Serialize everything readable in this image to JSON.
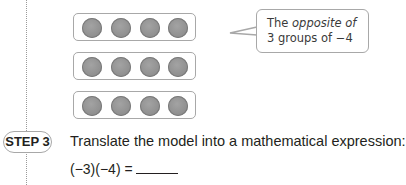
{
  "model": {
    "rows": 3,
    "counters_per_row": 4,
    "counter_color": "#8e8e8e"
  },
  "callout": {
    "line1_plain": "The ",
    "line1_italic": "opposite of",
    "line2": "3 groups of −4"
  },
  "step": {
    "badge": "STEP 3",
    "instruction": "Translate the model into a mathematical expression:",
    "expression": "(−3)(−4) ="
  }
}
